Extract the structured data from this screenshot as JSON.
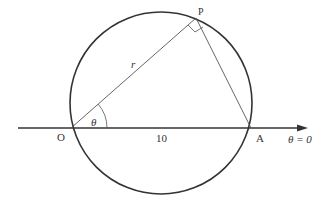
{
  "diagram": {
    "points": {
      "O": "O",
      "A": "A",
      "P": "P"
    },
    "labels": {
      "r": "r",
      "theta": "θ",
      "length": "10",
      "axis": "θ = 0"
    },
    "colors": {
      "line": "#333333",
      "background": "#ffffff"
    }
  }
}
